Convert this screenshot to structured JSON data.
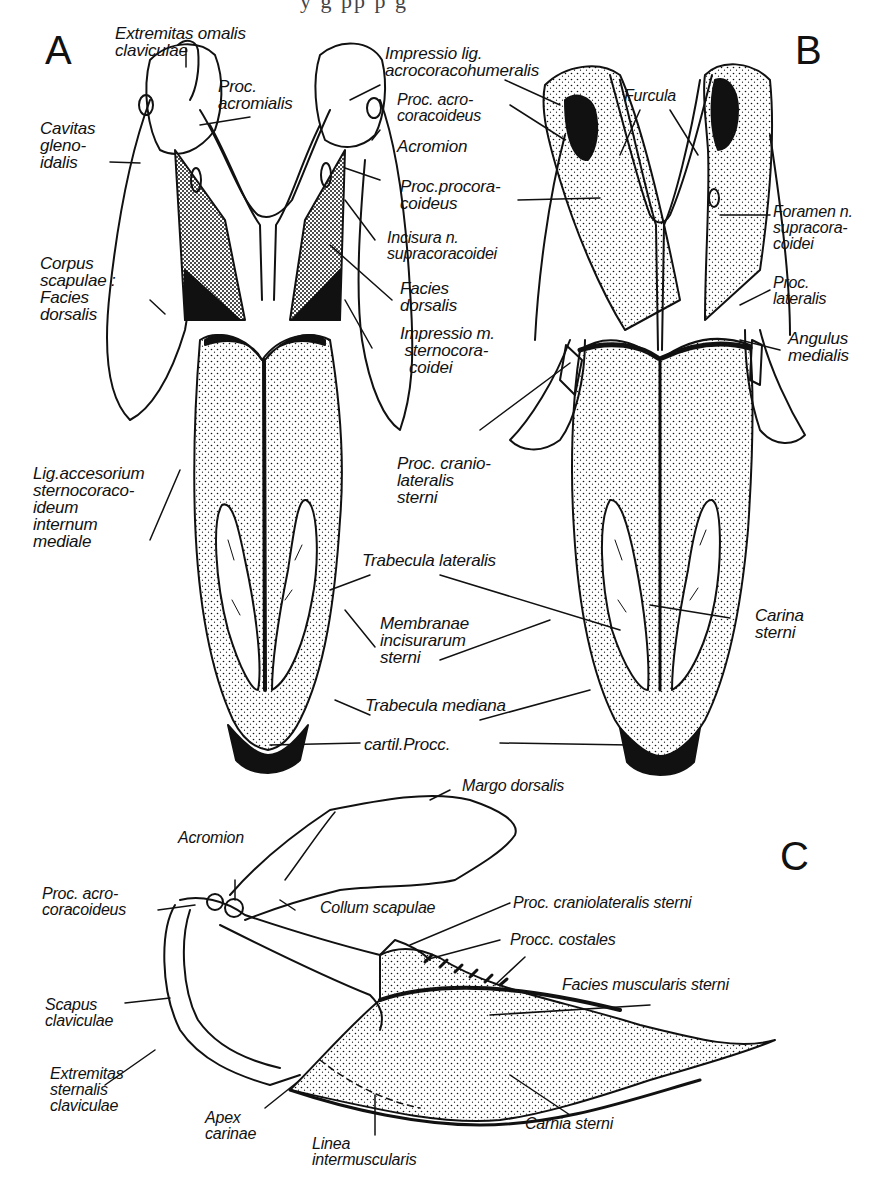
{
  "figure": {
    "top_cut_text": "y   g   pp   p   g",
    "panels": [
      {
        "id": "A",
        "label": "A"
      },
      {
        "id": "B",
        "label": "B"
      },
      {
        "id": "C",
        "label": "C"
      }
    ],
    "panel_A_labels": {
      "extremitas_omalis": "Extremitas omalis\nclaviculae",
      "proc_acromialis": "Proc.\nacromialis",
      "cavitas_glenoidalis": "Cavitas\ngleno-\nidalis",
      "corpus_scapulae": "Corpus\nscapulae :\nFacies\ndorsalis",
      "lig_accesorium": "Lig.accesorium\nsternocoraco-\nideum\ninternum\nmediale"
    },
    "shared_AB_labels": {
      "proc_acrocoracoideus": "Proc. acro-\ncoracoideus",
      "acromion": "Acromion",
      "proc_procoracoideus": "Proc.procora-\ncoideus",
      "incisura": "Incisura n.\nsupracoracoidei",
      "facies_dorsalis": "Facies\ndorsalis",
      "impressio_m": "Impressio m.\n sternocora-\n  coidei",
      "trabecula_lateralis": "Trabecula lateralis",
      "membranae": "Membranae\nincisurarum\nsterni",
      "trabecula_mediana": "Trabecula mediana",
      "cartil_procc": "cartil.Procc."
    },
    "panel_B_labels": {
      "impressio_lig": "Impressio lig.\nacrocoracohumeralis",
      "furcula": "Furcula",
      "foramen": "Foramen n.\nsupracora-\ncoidei",
      "proc_lateralis": "Proc.\nlateralis",
      "angulus_medialis": "Angulus\nmedialis",
      "proc_craniolateralis": "Proc. cranio-\nlateralis\nsterni",
      "carina_sterni": "Carina\nsterni"
    },
    "panel_C_labels": {
      "margo_dorsalis": "Margo dorsalis",
      "acromion": "Acromion",
      "proc_acrocoracoideus": "Proc. acro-\ncoracoideus",
      "collum_scapulae": "Collum scapulae",
      "proc_craniolateralis": "Proc. craniolateralis sterni",
      "procc_costales": "Procc. costales",
      "facies_muscularis": "Facies muscularis sterni",
      "scapus_claviculae": "Scapus\nclaviculae",
      "extremitas_sternalis": "Extremitas\nsternalis\nclaviculae",
      "apex_carinae": "Apex\ncarinae",
      "linea_intermuscularis": "Linea\nintermuscularis",
      "carnia_sterni": "Carnia sterni"
    }
  }
}
